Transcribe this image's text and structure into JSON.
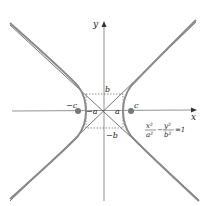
{
  "diagram": {
    "type": "hyperbola",
    "equation": {
      "num1": "x²",
      "den1": "a²",
      "minus": "−",
      "num2": "y²",
      "den2": "b²",
      "rhs": "=1"
    },
    "axes": {
      "x_label": "x",
      "y_label": "y"
    },
    "labels": {
      "a_pos": "a",
      "a_neg": "−a",
      "b_pos": "b",
      "b_neg": "−b",
      "c_pos": "c",
      "c_neg": "−c"
    },
    "colors": {
      "curve": "#7a7a7a",
      "asymptote": "#555555",
      "axis": "#666666",
      "dashed_box": "#444444",
      "focus": "#777777",
      "text": "#222222"
    }
  }
}
